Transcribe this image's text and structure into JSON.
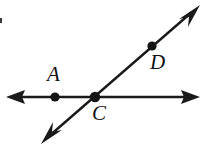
{
  "figure": {
    "background_color": "#ffffff",
    "stroke_color": "#1a1a1a",
    "label_color": "#111111",
    "width": 206,
    "height": 152,
    "labels": {
      "a": "A",
      "c": "C",
      "d": "D"
    },
    "points": [
      {
        "name": "A",
        "label": "A",
        "x": 55,
        "y": 97,
        "radius": 4.5,
        "on": "horizontal-line"
      },
      {
        "name": "C",
        "label": "C",
        "x": 95,
        "y": 97,
        "radius": 5.0,
        "on": "intersection"
      },
      {
        "name": "D",
        "label": "D",
        "x": 152,
        "y": 46,
        "radius": 4.5,
        "on": "diagonal-line"
      }
    ],
    "lines": [
      {
        "name": "horizontal-line",
        "x1": 10,
        "y1": 97,
        "x2": 197,
        "y2": 97,
        "stroke_width": 2.4,
        "arrow_start": true,
        "arrow_end": true
      },
      {
        "name": "diagonal-line",
        "x1": 45,
        "y1": 140,
        "x2": 197,
        "y2": 8,
        "stroke_width": 2.4,
        "arrow_start": true,
        "arrow_end": true
      }
    ],
    "artifacts": [
      {
        "name": "scan-speck",
        "x": 0,
        "y": 18,
        "width": 2,
        "height": 5
      }
    ]
  }
}
